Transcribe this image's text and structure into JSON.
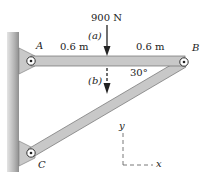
{
  "diagram": {
    "load": {
      "label": "900 N",
      "position_a": "(a)",
      "position_b": "(b)"
    },
    "points": {
      "A": "A",
      "B": "B",
      "C": "C"
    },
    "dimensions": {
      "left": "0.6 m",
      "right": "0.6 m"
    },
    "angle": "30°",
    "axes": {
      "y": "y",
      "x": "x"
    },
    "colors": {
      "member_fill": "#c8c8c8",
      "member_stroke": "#6e6e6e",
      "wall": "#b9b9b9",
      "ink": "#222222"
    }
  }
}
